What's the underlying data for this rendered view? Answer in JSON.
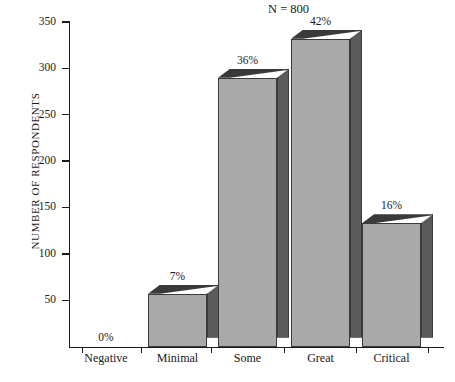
{
  "chart_data": {
    "type": "bar",
    "title": "N = 800",
    "xlabel": "",
    "ylabel": "NUMBER OF RESPONDENTS",
    "categories": [
      "Negative",
      "Minimal",
      "Some",
      "Great",
      "Critical"
    ],
    "values": [
      0,
      57,
      290,
      332,
      133
    ],
    "data_labels": [
      "0%",
      "7%",
      "36%",
      "42%",
      "16%"
    ],
    "percentages": [
      0,
      7,
      36,
      42,
      16
    ],
    "ylim": [
      0,
      350
    ],
    "yticks": [
      50,
      100,
      150,
      200,
      250,
      300,
      350
    ],
    "ytick_labels": [
      "50",
      "100",
      "150",
      "200",
      "250",
      "300",
      "350"
    ],
    "grid": false,
    "legend": null,
    "total_n": 800,
    "style": {
      "bar_face_color": "#a9a9a9",
      "bar_side_color": "#5a5a5a",
      "bar_top_color": "#8e8e8e",
      "axis_color": "#1a1a1a",
      "background": "#ffffff"
    }
  }
}
